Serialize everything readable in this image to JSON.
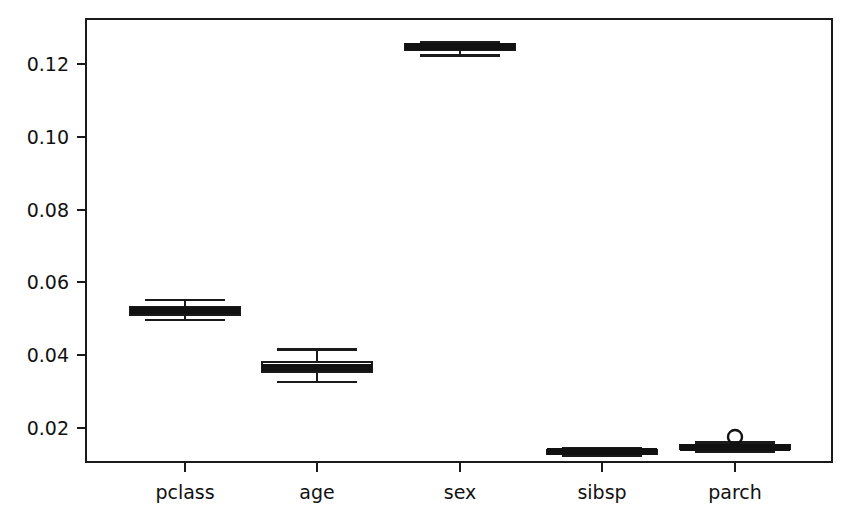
{
  "chart_data": {
    "type": "boxplot",
    "title": "",
    "xlabel": "",
    "ylabel": "",
    "categories": [
      "pclass",
      "age",
      "sex",
      "sibsp",
      "parch"
    ],
    "ylim": [
      0.0105,
      0.1325
    ],
    "ytick_labels": [
      "0.02",
      "0.04",
      "0.06",
      "0.08",
      "0.10",
      "0.12"
    ],
    "ytick_values": [
      0.02,
      0.04,
      0.06,
      0.08,
      0.1,
      0.12
    ],
    "grid": false,
    "legend": "none",
    "orientation": "vertical",
    "boxes": [
      {
        "name": "pclass",
        "whisker_low": 0.0496,
        "q1": 0.051,
        "median": 0.0521,
        "q3": 0.0531,
        "whisker_high": 0.0551,
        "outliers": []
      },
      {
        "name": "age",
        "whisker_low": 0.0325,
        "q1": 0.0354,
        "median": 0.0366,
        "q3": 0.038,
        "whisker_high": 0.0415,
        "outliers": []
      },
      {
        "name": "sex",
        "whisker_low": 0.1225,
        "q1": 0.124,
        "median": 0.1248,
        "q3": 0.1255,
        "whisker_high": 0.1262,
        "outliers": []
      },
      {
        "name": "sibsp",
        "whisker_low": 0.0122,
        "q1": 0.0128,
        "median": 0.0133,
        "q3": 0.0138,
        "whisker_high": 0.0143,
        "outliers": []
      },
      {
        "name": "parch",
        "whisker_low": 0.0133,
        "q1": 0.0141,
        "median": 0.0146,
        "q3": 0.0152,
        "whisker_high": 0.0158,
        "outliers": [
          0.0174
        ]
      }
    ]
  },
  "plot": {
    "frame": {
      "left": 86,
      "right": 832,
      "top": 19,
      "bottom": 462
    },
    "box_width": 110,
    "cap_width": 80,
    "category_centers": [
      185,
      317,
      460,
      602,
      735
    ]
  },
  "colors": {
    "line": "#1a1a1a",
    "box_fill": "#ffffff",
    "median": "#111111",
    "text": "#111111",
    "background": "#ffffff"
  }
}
